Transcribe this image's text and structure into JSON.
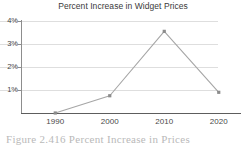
{
  "figure": {
    "caption": "Figure 2.416   Percent Increase in Prices"
  },
  "chart_data": {
    "type": "line",
    "title": "Percent Increase in Widget Prices",
    "xlabel": "",
    "ylabel": "",
    "categories": [
      "1990",
      "2000",
      "2010",
      "2020"
    ],
    "values": [
      0.0,
      0.75,
      3.55,
      0.9
    ],
    "series": [
      {
        "name": "Percent Increase",
        "values": [
          0.0,
          0.75,
          3.55,
          0.9
        ]
      }
    ],
    "ytick_labels": [
      "4%",
      "3%",
      "2%",
      "1%"
    ],
    "ytick_values": [
      4,
      3,
      2,
      1
    ],
    "ylim": [
      0,
      4
    ],
    "grid": true,
    "legend": false,
    "marker": "square",
    "line_color": "#a6a6a6",
    "marker_color": "#8c8c8c",
    "grid_color": "#dedede",
    "axis_color": "#5d5d5d",
    "text_color": "#3a3a3a"
  }
}
